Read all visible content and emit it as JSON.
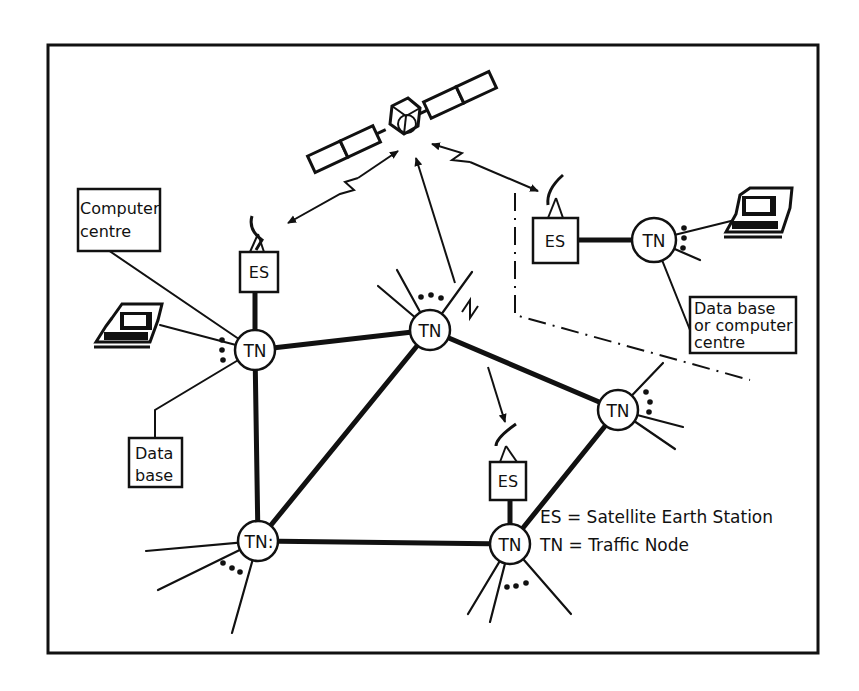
{
  "diagram": {
    "title": "",
    "satellite": {
      "label": ""
    },
    "nodes": [
      {
        "id": "tn-left",
        "label": "TN",
        "cx": 255,
        "cy": 350
      },
      {
        "id": "tn-center",
        "label": "TN",
        "cx": 430,
        "cy": 330
      },
      {
        "id": "tn-right-upper",
        "label": "TN",
        "cx": 618,
        "cy": 410
      },
      {
        "id": "tn-bottom-left",
        "label": "TN:",
        "cx": 258,
        "cy": 541
      },
      {
        "id": "tn-bottom-right",
        "label": "TN",
        "cx": 510,
        "cy": 544
      },
      {
        "id": "tn-remote",
        "label": "TN",
        "cx": 654,
        "cy": 240
      }
    ],
    "earth_stations": [
      {
        "id": "es-left",
        "label": "ES"
      },
      {
        "id": "es-remote",
        "label": "ES"
      },
      {
        "id": "es-bottom",
        "label": "ES"
      }
    ],
    "boxes": {
      "computer_centre": {
        "line1": "Computer",
        "line2": "centre"
      },
      "data_base": {
        "line1": "Data",
        "line2": "base"
      },
      "remote_db": {
        "line1": "Data base",
        "line2": "or computer",
        "line3": "centre"
      }
    },
    "legend": {
      "es": "ES = Satellite  Earth  Station",
      "tn": "TN = Traffic  Node"
    }
  }
}
